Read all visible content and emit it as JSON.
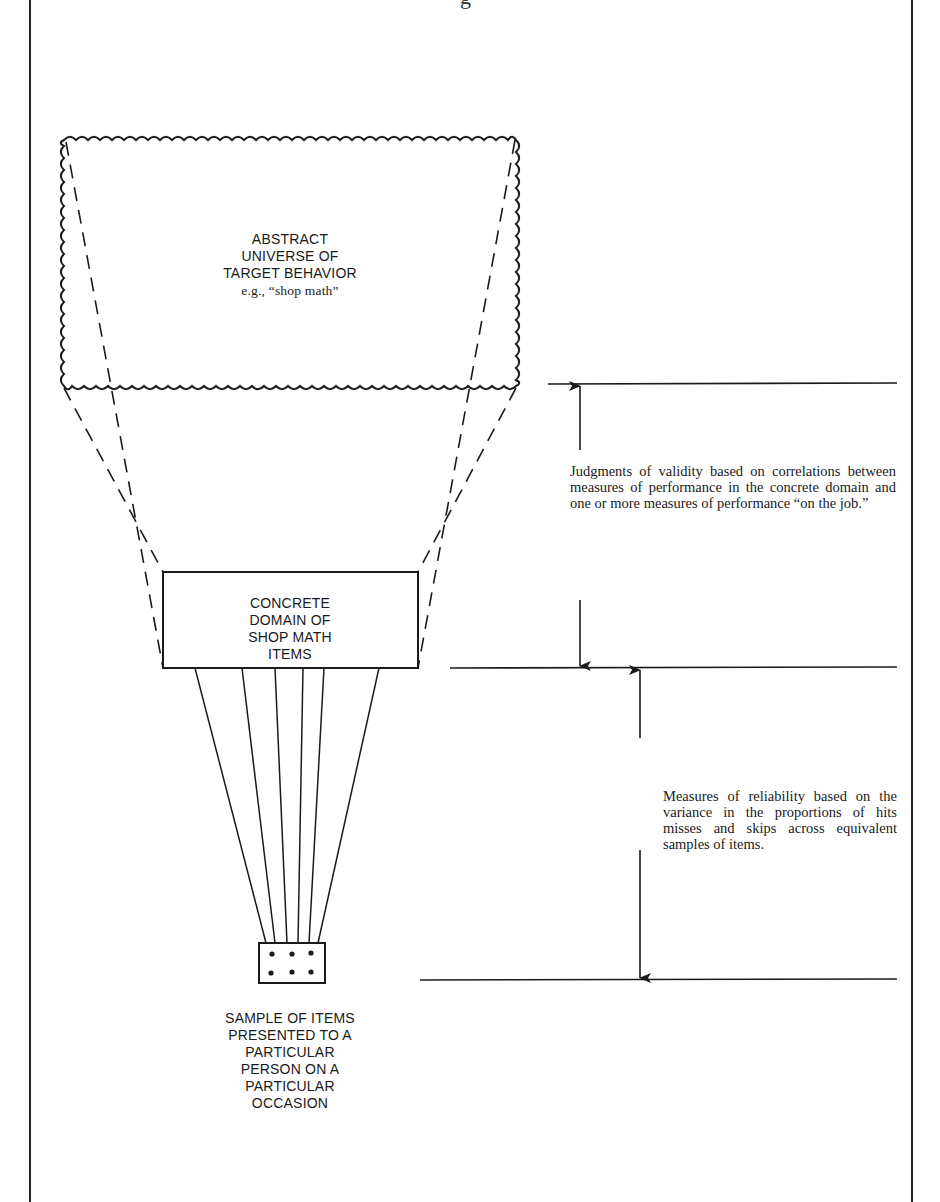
{
  "figure": {
    "title_fragment": "g",
    "universe_box": {
      "lines": [
        "ABSTRACT",
        "UNIVERSE OF",
        "TARGET BEHAVIOR"
      ],
      "example": "e.g., “shop math”"
    },
    "concrete_box": {
      "lines": [
        "CONCRETE",
        "DOMAIN OF",
        "SHOP MATH",
        "ITEMS"
      ]
    },
    "sample_box": {
      "dots": 6,
      "caption_lines": [
        "SAMPLE OF ITEMS",
        "PRESENTED TO A",
        "PARTICULAR",
        "PERSON ON A",
        "PARTICULAR",
        "OCCASION"
      ]
    },
    "validity_note": "Judgments of validity based on correlations between measures of performance in the concrete domain and one or more measures of performance “on the job.”",
    "reliability_note": "Measures of reliability based on the variance in the proportions of hits misses and skips across equivalent samples of items."
  },
  "colors": {
    "ink": "#1a1a1a",
    "paper": "#ffffff"
  }
}
